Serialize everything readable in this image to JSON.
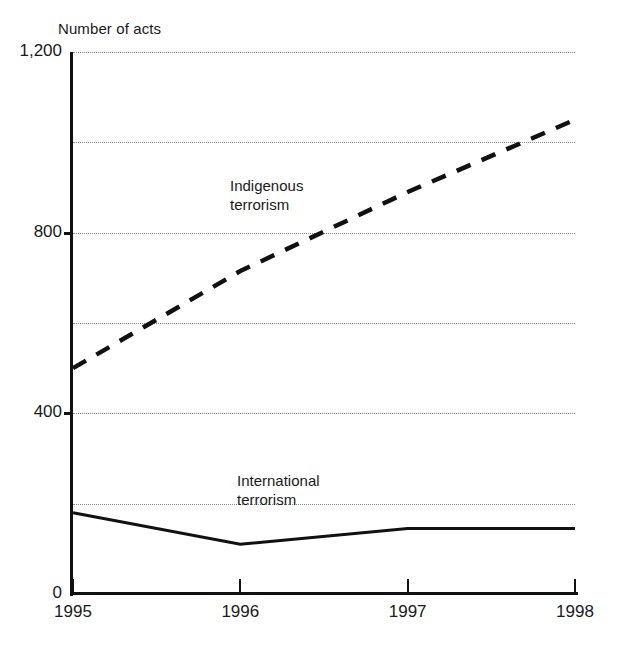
{
  "chart_data": {
    "type": "line",
    "title": "",
    "axis_title": "Number of acts",
    "xlabel": "",
    "ylabel": "Number of acts",
    "categories": [
      "1995",
      "1996",
      "1997",
      "1998"
    ],
    "x": [
      1995,
      1996,
      1997,
      1998
    ],
    "series": [
      {
        "name": "Indigenous terrorism",
        "label": "Indigenous\nterrorism",
        "style": "dashed",
        "color": "#111111",
        "values": [
          500,
          715,
          890,
          1050
        ]
      },
      {
        "name": "International terrorism",
        "label": "International\nterrorism",
        "style": "solid",
        "color": "#111111",
        "values": [
          180,
          110,
          145,
          145
        ]
      }
    ],
    "ylim": [
      0,
      1200
    ],
    "ytick_values": [
      0,
      200,
      400,
      600,
      800,
      1000,
      1200
    ],
    "ytick_labels": [
      "0",
      "",
      "400",
      "",
      "800",
      "",
      "1,200"
    ],
    "yticks_labeled": [
      "0",
      "400",
      "800",
      "1,200"
    ],
    "gridlines": {
      "horizontal": [
        200,
        400,
        600,
        800,
        1000,
        1200
      ],
      "style": "dotted",
      "color": "#8a8a8a",
      "vertical": []
    },
    "legend": {
      "position": "inline-annotations",
      "entries": [
        "Indigenous terrorism",
        "International terrorism"
      ]
    },
    "background": "#ffffff"
  },
  "axis": {
    "y_labels": [
      {
        "text": "1,200",
        "value": 1200
      },
      {
        "text": "800",
        "value": 800
      },
      {
        "text": "400",
        "value": 400
      },
      {
        "text": "0",
        "value": 0
      }
    ],
    "x_labels": [
      {
        "text": "1995",
        "value": 1995
      },
      {
        "text": "1996",
        "value": 1996
      },
      {
        "text": "1997",
        "value": 1997
      },
      {
        "text": "1998",
        "value": 1998
      }
    ]
  }
}
